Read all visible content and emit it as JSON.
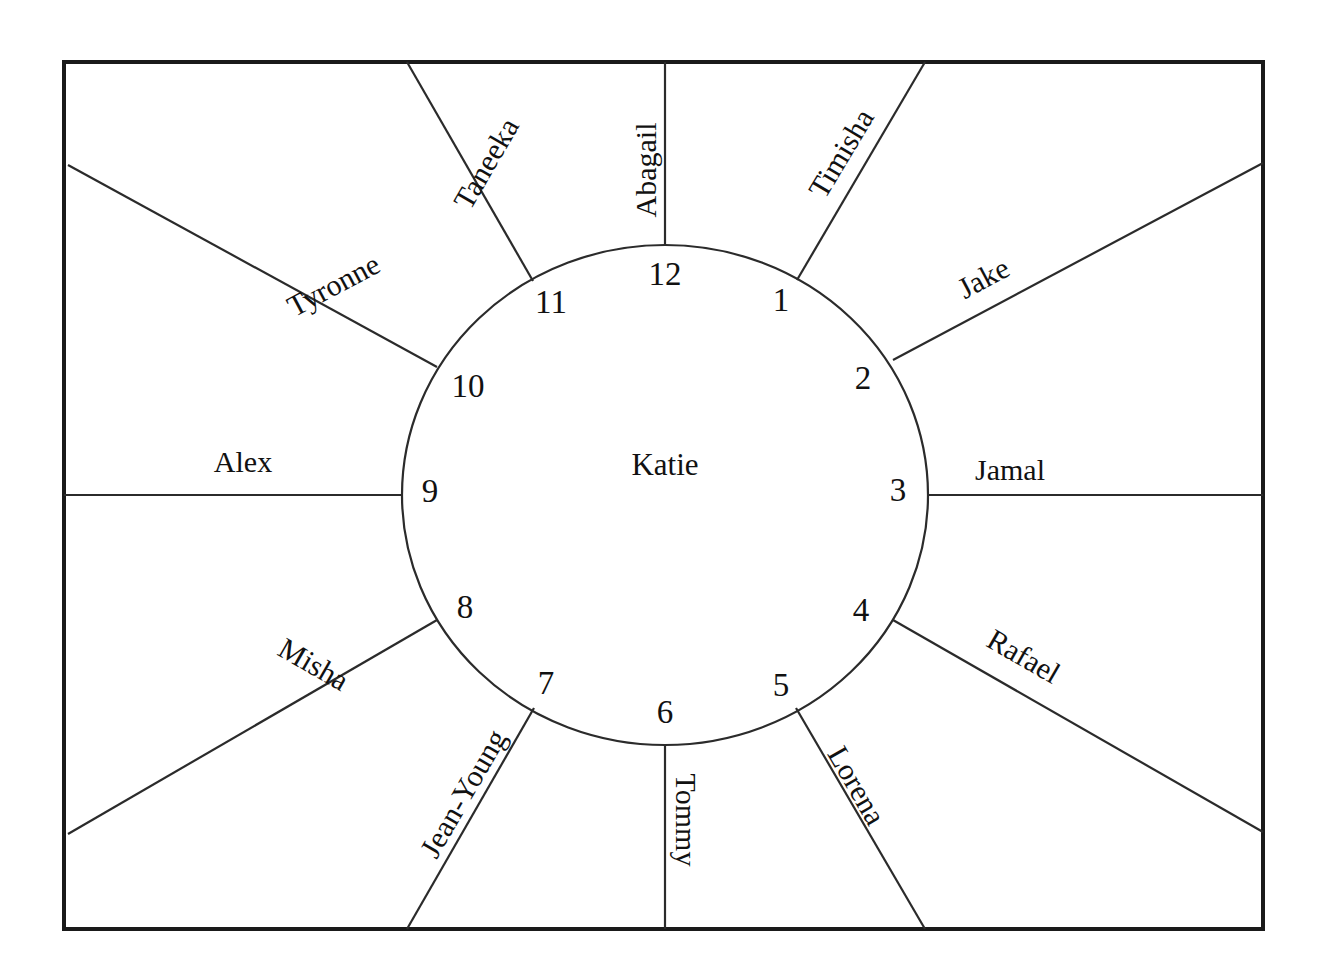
{
  "diagram": {
    "type": "clock-face-relationship-map",
    "center_label": "Katie",
    "frame": {
      "x": 64,
      "y": 62,
      "width": 1199,
      "height": 867,
      "stroke": "#1a1a1a",
      "stroke_width": 4
    },
    "circle": {
      "cx": 665,
      "cy": 495,
      "rx": 263,
      "ry": 250,
      "stroke": "#2b2b2b",
      "stroke_width": 2.2
    },
    "hours": [
      {
        "number": "12",
        "angle_deg": 0,
        "x": 665,
        "y": 277
      },
      {
        "number": "1",
        "angle_deg": 30,
        "x": 781,
        "y": 303
      },
      {
        "number": "2",
        "angle_deg": 60,
        "x": 863,
        "y": 381
      },
      {
        "number": "3",
        "angle_deg": 90,
        "x": 898,
        "y": 493
      },
      {
        "number": "4",
        "angle_deg": 120,
        "x": 861,
        "y": 613
      },
      {
        "number": "5",
        "angle_deg": 150,
        "x": 781,
        "y": 688
      },
      {
        "number": "6",
        "angle_deg": 180,
        "x": 665,
        "y": 715
      },
      {
        "number": "7",
        "angle_deg": 210,
        "x": 546,
        "y": 686
      },
      {
        "number": "8",
        "angle_deg": 240,
        "x": 465,
        "y": 610
      },
      {
        "number": "9",
        "angle_deg": 270,
        "x": 430,
        "y": 494
      },
      {
        "number": "10",
        "angle_deg": 300,
        "x": 468,
        "y": 389
      },
      {
        "number": "11",
        "angle_deg": 330,
        "x": 551,
        "y": 305
      }
    ],
    "spokes": [
      {
        "name": "Abagail",
        "hour": "12",
        "x1": 665,
        "y1": 245,
        "x2": 665,
        "y2": 62,
        "label_x": 649,
        "label_y": 170,
        "label_rotation": -90
      },
      {
        "name": "Timisha",
        "hour": "1",
        "x1": 797,
        "y1": 280,
        "x2": 925,
        "y2": 62,
        "label_x": 844,
        "label_y": 155,
        "label_rotation": -59
      },
      {
        "name": "Jake",
        "hour": "2",
        "x1": 893,
        "y1": 360,
        "x2": 1263,
        "y2": 163,
        "label_x": 985,
        "label_y": 281,
        "label_rotation": -28
      },
      {
        "name": "Jamal",
        "hour": "3",
        "x1": 928,
        "y1": 495,
        "x2": 1263,
        "y2": 495,
        "label_x": 1010,
        "label_y": 473,
        "label_rotation": 0
      },
      {
        "name": "Rafael",
        "hour": "4",
        "x1": 893,
        "y1": 620,
        "x2": 1263,
        "y2": 832,
        "label_x": 1022,
        "label_y": 659,
        "label_rotation": 30
      },
      {
        "name": "Lorena",
        "hour": "5",
        "x1": 796,
        "y1": 708,
        "x2": 925,
        "y2": 929,
        "label_x": 854,
        "label_y": 787,
        "label_rotation": 60
      },
      {
        "name": "Tommy",
        "hour": "6",
        "x1": 665,
        "y1": 745,
        "x2": 665,
        "y2": 929,
        "label_x": 683,
        "label_y": 820,
        "label_rotation": 90
      },
      {
        "name": "Jean-Young",
        "hour": "7",
        "x1": 534,
        "y1": 708,
        "x2": 407,
        "y2": 929,
        "label_x": 466,
        "label_y": 795,
        "label_rotation": -60
      },
      {
        "name": "Misha",
        "hour": "8",
        "x1": 437,
        "y1": 620,
        "x2": 68,
        "y2": 834,
        "label_x": 312,
        "label_y": 667,
        "label_rotation": 30
      },
      {
        "name": "Alex",
        "hour": "9",
        "x1": 402,
        "y1": 495,
        "x2": 64,
        "y2": 495,
        "label_x": 243,
        "label_y": 465,
        "label_rotation": 0
      },
      {
        "name": "Tyronne",
        "hour": "10",
        "x1": 437,
        "y1": 367,
        "x2": 68,
        "y2": 165,
        "label_x": 335,
        "label_y": 288,
        "label_rotation": -28
      },
      {
        "name": "Taneeka",
        "hour": "11",
        "x1": 533,
        "y1": 281,
        "x2": 407,
        "y2": 62,
        "label_x": 489,
        "label_y": 165,
        "label_rotation": -60
      }
    ],
    "center": {
      "x": 665,
      "y": 468
    }
  }
}
